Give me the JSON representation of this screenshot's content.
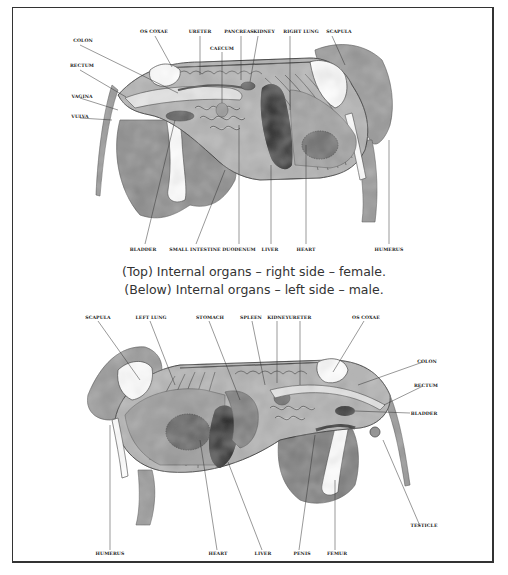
{
  "top_diagram": {
    "title": "Internal organs - right side - female",
    "labels": {
      "os_coxae": "OS COXAE",
      "ureter": "URETER",
      "pancreas": "PANCREAS",
      "kidney": "KIDNEY",
      "right_lung": "RIGHT LUNG",
      "scapula": "SCAPULA",
      "caecum": "CAECUM",
      "colon": "COLON",
      "rectum": "RECTUM",
      "vagina": "VAGINA",
      "vulva": "VULVA",
      "bladder": "BLADDER",
      "small_intestine": "SMALL INTESTINE",
      "duodenum": "DUODENUM",
      "liver": "LIVER",
      "heart": "HEART",
      "humerus": "HUMERUS"
    }
  },
  "caption": {
    "line1": "(Top) Internal organs – right side – female.",
    "line2": "(Below) Internal organs – left side – male."
  },
  "bottom_diagram": {
    "title": "Internal organs - left side - male",
    "labels": {
      "scapula": "SCAPULA",
      "left_lung": "LEFT LUNG",
      "stomach": "STOMACH",
      "spleen": "SPLEEN",
      "kidney": "KIDNEY",
      "ureter": "URETER",
      "os_coxae": "OS COXAE",
      "colon": "COLON",
      "rectum": "RECTUM",
      "bladder": "BLADDER",
      "testicle": "TESTICLE",
      "humerus": "HUMERUS",
      "heart": "HEART",
      "liver": "LIVER",
      "penis": "PENIS",
      "femur": "FEMUR"
    }
  },
  "colors": {
    "frame": "#333333",
    "tissue_light": "#a8a8a8",
    "tissue_mid": "#8a8a8a",
    "tissue_dark": "#5e5e5e",
    "organ_black": "#1a1a1a",
    "bone": "#ffffff",
    "label": "#222222"
  }
}
